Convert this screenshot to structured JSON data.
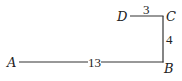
{
  "diagram": {
    "points": {
      "A": {
        "label": "A"
      },
      "B": {
        "label": "B"
      },
      "C": {
        "label": "C"
      },
      "D": {
        "label": "D"
      }
    },
    "segments": [
      {
        "from": "A",
        "to": "B",
        "length": "13"
      },
      {
        "from": "B",
        "to": "C",
        "length": "4"
      },
      {
        "from": "C",
        "to": "D",
        "length": "3"
      }
    ],
    "colors": {
      "stroke": "#333333",
      "text": "#222222",
      "background": "#ffffff"
    }
  }
}
